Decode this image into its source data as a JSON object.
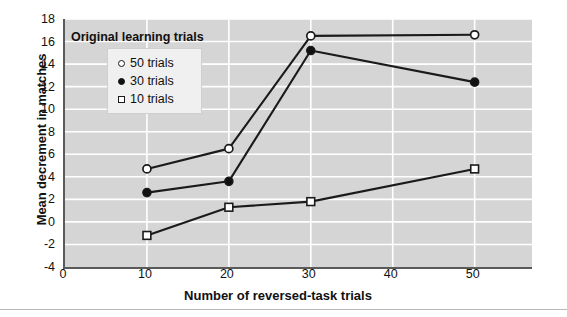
{
  "chart_data": {
    "type": "line",
    "title": "",
    "xlabel": "Number of reversed-task trials",
    "ylabel": "Mean decrement in matches",
    "xlim": [
      0,
      57
    ],
    "ylim": [
      -4,
      18
    ],
    "xticks": [
      0,
      10,
      20,
      30,
      40,
      50
    ],
    "yticks": [
      -4,
      -2,
      0,
      2,
      4,
      6,
      8,
      10,
      12,
      14,
      16,
      18
    ],
    "grid": "both-light-white",
    "legend_title": "Original learning trials",
    "legend_position": "upper-left-inside",
    "x": [
      10,
      20,
      30,
      50
    ],
    "series": [
      {
        "name": "50 trials",
        "marker": "open-circle",
        "values": [
          4.7,
          6.5,
          16.5,
          16.6
        ]
      },
      {
        "name": "30 trials",
        "marker": "filled-circle",
        "values": [
          2.6,
          3.6,
          15.2,
          12.4
        ]
      },
      {
        "name": "10 trials",
        "marker": "open-square",
        "values": [
          -1.2,
          1.3,
          1.8,
          4.7
        ]
      }
    ]
  },
  "axes": {
    "ylabel": "Mean decrement in matches",
    "xlabel": "Number of reversed-task trials",
    "ytick_labels": [
      "18",
      "16",
      "14",
      "12",
      "10",
      "8",
      "6",
      "4",
      "2",
      "0",
      "-2",
      "-4"
    ],
    "xtick_labels": [
      "0",
      "10",
      "20",
      "30",
      "40",
      "50"
    ]
  },
  "legend": {
    "title": "Original learning trials",
    "items": [
      {
        "label": "50 trials",
        "marker": "open-circle"
      },
      {
        "label": "30 trials",
        "marker": "filled-circle"
      },
      {
        "label": "10 trials",
        "marker": "open-square"
      }
    ]
  },
  "colors": {
    "plot_background": "#d5d5d5",
    "gridline": "#ffffff",
    "axis": "#5a5a5a",
    "line": "#1a1a1a",
    "marker_fill_open": "#ffffff",
    "marker_fill_solid": "#111111",
    "legend_background": "#f0f0f0",
    "page_background": "#ffffff"
  }
}
